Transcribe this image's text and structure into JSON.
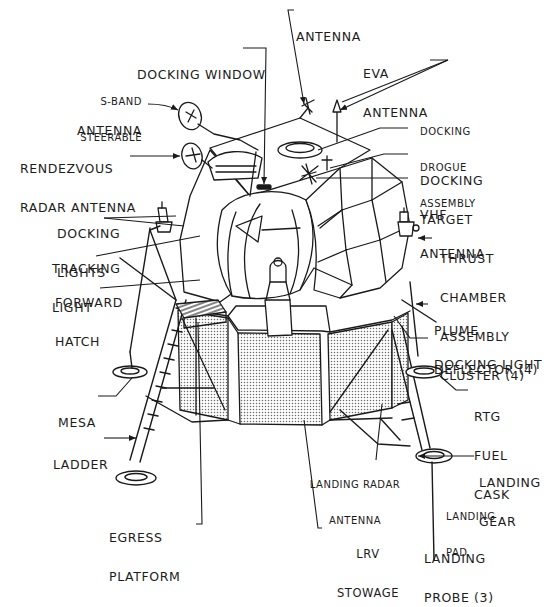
{
  "diagram": {
    "colors": {
      "ink": "#1a1a1a",
      "background": "#ffffff",
      "stipple": "#bdbdbd"
    },
    "labels": {
      "docking_window": {
        "lines": [
          "DOCKING WINDOW"
        ]
      },
      "antenna": {
        "lines": [
          "ANTENNA"
        ]
      },
      "eva_antenna": {
        "lines": [
          "EVA",
          "ANTENNA"
        ]
      },
      "s_band": {
        "lines": [
          "S-BAND",
          "STEERABLE",
          "ANTENNA"
        ]
      },
      "docking_drogue": {
        "lines": [
          "DOCKING",
          "DROGUE",
          "ASSEMBLY"
        ]
      },
      "rendezvous_radar": {
        "lines": [
          "RENDEZVOUS",
          "RADAR ANTENNA"
        ]
      },
      "docking_target": {
        "lines": [
          "DOCKING",
          "TARGET"
        ]
      },
      "vhf_antenna": {
        "lines": [
          "VHF",
          "ANTENNA"
        ]
      },
      "docking_lights": {
        "lines": [
          "DOCKING",
          "LIGHTS"
        ]
      },
      "tracking_light": {
        "lines": [
          "TRACKING",
          "LIGHT"
        ]
      },
      "thrust_chamber": {
        "lines": [
          "THRUST",
          "CHAMBER",
          "ASSEMBLY",
          "CLUSTER (4)"
        ]
      },
      "forward_hatch": {
        "lines": [
          "FORWARD",
          "HATCH"
        ]
      },
      "plume_deflector": {
        "lines": [
          "PLUME",
          "DEFLECTOR (4)"
        ]
      },
      "docking_light": {
        "lines": [
          "DOCKING LIGHT"
        ]
      },
      "mesa": {
        "lines": [
          "MESA"
        ]
      },
      "rtg_fuel_cask": {
        "lines": [
          "RTG",
          "FUEL",
          "CASK"
        ]
      },
      "ladder": {
        "lines": [
          "LADDER"
        ]
      },
      "landing_radar_antenna": {
        "lines": [
          "LANDING RADAR",
          "ANTENNA"
        ]
      },
      "landing_gear": {
        "lines": [
          "LANDING",
          "GEAR"
        ]
      },
      "landing_pad": {
        "lines": [
          "LANDING",
          "PAD"
        ]
      },
      "egress_platform": {
        "lines": [
          "EGRESS",
          "PLATFORM"
        ]
      },
      "lrv_stowage": {
        "lines": [
          "LRV",
          "STOWAGE"
        ]
      },
      "landing_probe": {
        "lines": [
          "LANDING",
          "PROBE (3)"
        ]
      }
    }
  }
}
